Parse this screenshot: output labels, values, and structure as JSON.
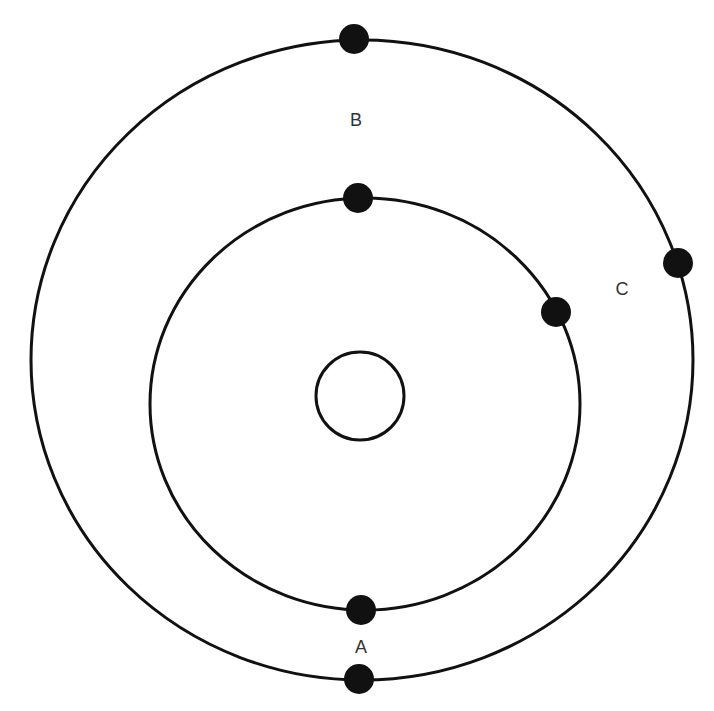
{
  "diagram": {
    "type": "atomic-shell-model",
    "colors": {
      "stroke": "#111111",
      "background": "#ffffff",
      "label": "#333333"
    },
    "nucleus": {
      "cx": 360,
      "cy": 396,
      "r": 44
    },
    "shells": [
      {
        "name": "inner-shell",
        "cx": 365,
        "cy": 404,
        "rx": 215,
        "ry": 206
      },
      {
        "name": "outer-shell",
        "cx": 362,
        "cy": 360,
        "rx": 331,
        "ry": 320
      }
    ],
    "electrons": [
      {
        "name": "outer-top",
        "cx": 354,
        "cy": 39
      },
      {
        "name": "outer-right",
        "cx": 678,
        "cy": 263
      },
      {
        "name": "outer-bottom",
        "cx": 359,
        "cy": 679
      },
      {
        "name": "inner-top",
        "cx": 358,
        "cy": 198
      },
      {
        "name": "inner-right",
        "cx": 556,
        "cy": 312
      },
      {
        "name": "inner-bottom",
        "cx": 361,
        "cy": 610
      }
    ],
    "electron_radius": 15,
    "labels": [
      {
        "text": "A",
        "x": 361,
        "y": 647
      },
      {
        "text": "B",
        "x": 356,
        "y": 120
      },
      {
        "text": "C",
        "x": 622,
        "y": 289
      }
    ]
  }
}
